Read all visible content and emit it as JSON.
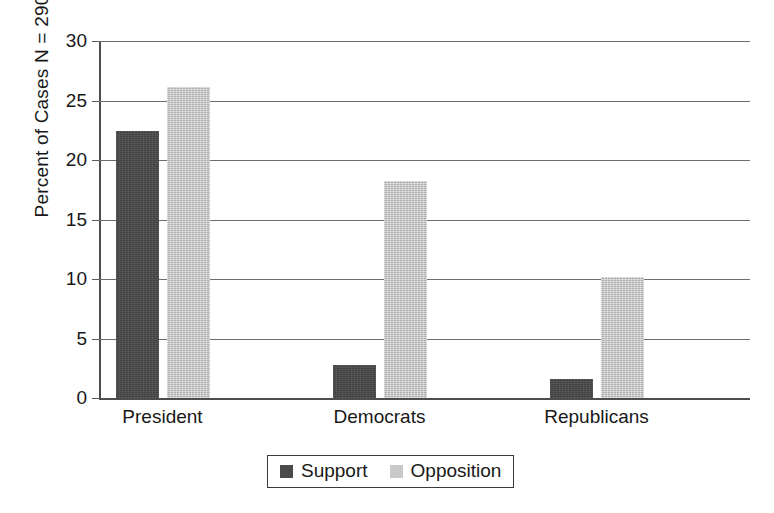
{
  "chart_data": {
    "type": "bar",
    "title": "",
    "xlabel": "",
    "ylabel": "Percent of Cases N = 290",
    "categories": [
      "President",
      "Democrats",
      "Republicans"
    ],
    "series": [
      {
        "name": "Support",
        "color": "#4a4a4a",
        "values": [
          22.4,
          2.8,
          1.6
        ]
      },
      {
        "name": "Opposition",
        "color": "#c9c9c9",
        "values": [
          26.1,
          18.2,
          10.2
        ]
      }
    ],
    "ylim": [
      0,
      30
    ],
    "yticks": [
      0,
      5,
      10,
      15,
      20,
      25,
      30
    ],
    "ytick_labels": [
      "0",
      "5",
      "10",
      "15",
      "20",
      "25",
      "30"
    ],
    "grid": true,
    "grid_axis": "y",
    "legend_position": "bottom-center",
    "legend_entries": [
      "Support",
      "Opposition"
    ],
    "n_total": 290
  },
  "axis": {
    "y_title": "Percent of Cases N = 290"
  },
  "legend": {
    "items": [
      {
        "label": "Support"
      },
      {
        "label": "Opposition"
      }
    ]
  }
}
